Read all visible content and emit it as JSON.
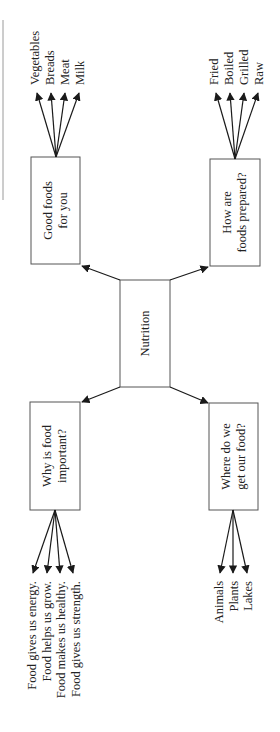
{
  "diagram": {
    "type": "concept-map",
    "orientation": "rotated-90-ccw",
    "center": {
      "label": "Nutrition"
    },
    "branches": [
      {
        "id": "good-foods",
        "label_lines": [
          "Good foods",
          "for you"
        ],
        "children": [
          "Vegetables",
          "Breads",
          "Meat",
          "Milk"
        ]
      },
      {
        "id": "how-prepared",
        "label_lines": [
          "How are",
          "foods prepared?"
        ],
        "children": [
          "Fried",
          "Boiled",
          "Grilled",
          "Raw"
        ]
      },
      {
        "id": "why-important",
        "label_lines": [
          "Why is food",
          "important?"
        ],
        "children": [
          "Food gives us energy.",
          "Food helps us grow.",
          "Food makes us healthy.",
          "Food gives us strength."
        ]
      },
      {
        "id": "where-from",
        "label_lines": [
          "Where do we",
          "get our food?"
        ],
        "children": [
          "Animals",
          "Plants",
          "Lakes"
        ]
      }
    ],
    "colors": {
      "box_stroke": "#555555",
      "arrow": "#1a1a1a",
      "text": "#222222",
      "background": "#ffffff"
    }
  }
}
